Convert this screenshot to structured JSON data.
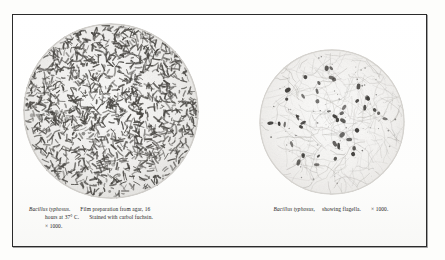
{
  "plate": {
    "background_color": "#fdfdfb",
    "frame_color": "#2b2b2b"
  },
  "figures": [
    {
      "id": "left",
      "micrograph": {
        "name": "photomicrograph-bacillus-typhosus-film-preparation",
        "style": "dense rod-shaped bacilli stained dark on pale ground",
        "field_tint": "#f1f0ee",
        "organism_color": "#4a4844"
      },
      "caption": {
        "species": "Bacillus typhosus.",
        "line1_rest": "Film preparation from agar, 16",
        "line2": "hours at 37° C.",
        "line2_rest": "Stained with carbol fuchsin.",
        "line3": "× 1000."
      }
    },
    {
      "id": "right",
      "micrograph": {
        "name": "photomicrograph-bacillus-typhosus-showing-flagella",
        "style": "sparse dark bacilli with fine flagella threads on pale mottled ground",
        "field_tint": "#f4f3f1",
        "organism_color": "#3a3835"
      },
      "caption": {
        "species": "Bacillus typhosus,",
        "line1_rest": "showing flagella.",
        "magnification": "× 1000."
      }
    }
  ]
}
